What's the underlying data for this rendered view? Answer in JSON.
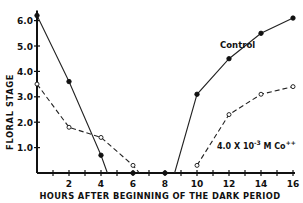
{
  "chart_data": {
    "type": "line",
    "title": "",
    "xlabel": "HOURS AFTER BEGINNING OF THE DARK PERIOD",
    "ylabel": "FLORAL STAGE",
    "xlim": [
      0,
      16
    ],
    "ylim": [
      0,
      6.2
    ],
    "x_ticks": [
      2,
      4,
      6,
      8,
      10,
      12,
      14,
      16
    ],
    "y_ticks": [
      "1.0",
      "2.0",
      "3.0",
      "4.0",
      "5.0",
      "6.0"
    ],
    "grid": false,
    "series": [
      {
        "name": "Control",
        "marker": "filled-circle",
        "line": "solid",
        "segments": [
          [
            [
              0,
              6.2
            ],
            [
              2,
              3.6
            ],
            [
              4,
              0.7
            ],
            [
              4.4,
              0
            ]
          ],
          [
            [
              8.6,
              0
            ],
            [
              10,
              3.1
            ],
            [
              12,
              4.5
            ],
            [
              14,
              5.5
            ],
            [
              16,
              6.1
            ]
          ]
        ],
        "points": [
          [
            0,
            6.2
          ],
          [
            2,
            3.6
          ],
          [
            4,
            0.7
          ],
          [
            6,
            0
          ],
          [
            8,
            0
          ],
          [
            10,
            3.1
          ],
          [
            12,
            4.5
          ],
          [
            14,
            5.5
          ],
          [
            16,
            6.1
          ]
        ]
      },
      {
        "name": "4.0 X 10^-3 M Co++",
        "marker": "open-circle",
        "line": "dashed",
        "segments": [
          [
            [
              0,
              3.5
            ],
            [
              2,
              1.8
            ],
            [
              4,
              1.4
            ],
            [
              6,
              0.3
            ],
            [
              6.4,
              0
            ]
          ],
          [
            [
              10,
              0.3
            ],
            [
              12,
              2.3
            ],
            [
              14,
              3.1
            ],
            [
              16,
              3.4
            ]
          ]
        ],
        "points": [
          [
            0,
            3.5
          ],
          [
            2,
            1.8
          ],
          [
            4,
            1.4
          ],
          [
            6,
            0.3
          ],
          [
            10,
            0.3
          ],
          [
            12,
            2.3
          ],
          [
            14,
            3.1
          ],
          [
            16,
            3.4
          ]
        ]
      }
    ],
    "annotations": [
      {
        "text": "Control",
        "x": 10.9,
        "y": 5.0
      },
      {
        "text": "4.0 X 10",
        "sup": "-3",
        "rest": " M Co",
        "sup2": "++",
        "x": 11.5,
        "y": 1.1
      }
    ]
  },
  "labels": {
    "xlabel": "HOURS AFTER BEGINNING OF THE DARK PERIOD",
    "ylabel": "FLORAL STAGE",
    "control": "Control",
    "co_main": "4.0 X 10",
    "co_exp": "-3",
    "co_unit": " M Co",
    "co_charge": "++"
  }
}
